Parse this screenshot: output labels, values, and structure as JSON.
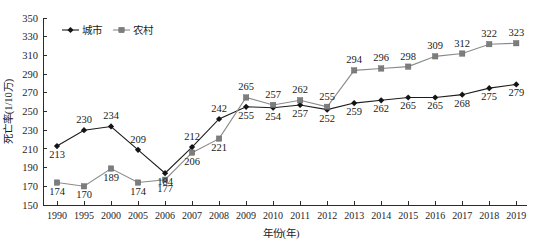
{
  "chart_data": {
    "type": "line",
    "title": "",
    "xlabel": "年份(年)",
    "ylabel": "死亡率(1/10万)",
    "ylim": [
      150,
      350
    ],
    "ytick_step": 20,
    "yticks": [
      150,
      170,
      190,
      210,
      230,
      250,
      270,
      290,
      310,
      330,
      350
    ],
    "grid": false,
    "legend_position": "top-left",
    "categories": [
      "1990",
      "1995",
      "2000",
      "2005",
      "2006",
      "2007",
      "2008",
      "2009",
      "2010",
      "2011",
      "2012",
      "2013",
      "2014",
      "2015",
      "2016",
      "2017",
      "2018",
      "2019"
    ],
    "series": [
      {
        "name": "城市",
        "marker": "diamond",
        "color": "#141414",
        "values": [
          213,
          230,
          234,
          209,
          184,
          212,
          242,
          255,
          254,
          257,
          252,
          259,
          262,
          265,
          265,
          268,
          275,
          279
        ],
        "label_positions": [
          "below",
          "above",
          "above",
          "above",
          "below",
          "above",
          "above",
          "below",
          "below",
          "below",
          "below",
          "below",
          "below",
          "below",
          "below",
          "below",
          "below",
          "below"
        ]
      },
      {
        "name": "农村",
        "marker": "square",
        "color": "#7d7d7d",
        "values": [
          174,
          170,
          189,
          174,
          177,
          206,
          221,
          265,
          257,
          262,
          255,
          294,
          296,
          298,
          309,
          312,
          322,
          323
        ],
        "label_positions": [
          "below",
          "below",
          "below",
          "below",
          "below",
          "below",
          "below",
          "above",
          "above",
          "above",
          "above",
          "above",
          "above",
          "above",
          "above",
          "above",
          "above",
          "above"
        ]
      }
    ]
  },
  "legend": {
    "items": [
      {
        "label": "城市",
        "marker": "diamond",
        "color": "#141414"
      },
      {
        "label": "农村",
        "marker": "square",
        "color": "#7d7d7d"
      }
    ]
  },
  "axes": {
    "y_title": "死亡率(1/10万)",
    "x_title": "年份(年)"
  },
  "colors": {
    "urban": "#141414",
    "rural": "#7d7d7d",
    "axis": "#2b2b2b",
    "background": "#ffffff",
    "text": "#1a1a1a"
  }
}
